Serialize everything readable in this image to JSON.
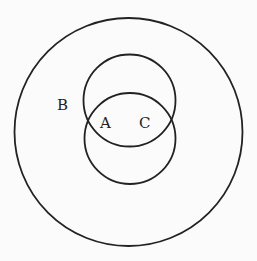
{
  "diagram": {
    "type": "venn",
    "background": "#fbfbfb",
    "stroke_color": "#222222",
    "text_color": "#222222",
    "circles": [
      {
        "name": "outer",
        "label": "B",
        "cx": 128.5,
        "cy": 132,
        "r": 114
      },
      {
        "name": "upper-inner",
        "label": "A",
        "cx": 129.5,
        "cy": 100.5,
        "r": 46
      },
      {
        "name": "lower-inner",
        "label": "C",
        "cx": 130,
        "cy": 138.5,
        "r": 45.5
      }
    ],
    "labels": [
      {
        "text": "B",
        "x": 57,
        "y": 110
      },
      {
        "text": "A",
        "x": 100,
        "y": 128
      },
      {
        "text": "C",
        "x": 139,
        "y": 128
      }
    ]
  }
}
